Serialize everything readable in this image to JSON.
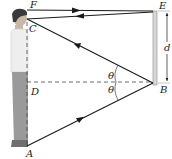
{
  "diagram": {
    "points": {
      "F": {
        "label": "F"
      },
      "C": {
        "label": "C"
      },
      "D": {
        "label": "D"
      },
      "A": {
        "label": "A"
      },
      "E": {
        "label": "E"
      },
      "B": {
        "label": "B"
      }
    },
    "distance_label": "d",
    "angle_label_upper": "θ",
    "angle_label_lower": "θ",
    "colors": {
      "ray": "#1a1a1a",
      "mirror": "#d8d8d8",
      "mirror_edge": "#8a8a8a",
      "person_shirt": "#e8e8e8",
      "person_pants": "#9a9a9a",
      "person_hair": "#3a3a3a",
      "person_skin": "#c8b8a8"
    }
  }
}
